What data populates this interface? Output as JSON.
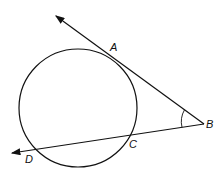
{
  "diagram": {
    "type": "geometry",
    "points": {
      "A": {
        "label": "A",
        "x": 114,
        "y": 57
      },
      "B": {
        "label": "B",
        "x": 204,
        "y": 124
      },
      "C": {
        "label": "C",
        "x": 131,
        "y": 134
      },
      "D": {
        "label": "D",
        "x": 30,
        "y": 151
      }
    },
    "circle": {
      "cx": 78,
      "cy": 108,
      "r": 59
    },
    "lines": [
      {
        "name": "tangent-ray-BA",
        "from": "B",
        "to_arrow": [
          55,
          15
        ]
      },
      {
        "name": "secant-ray-BD",
        "from": "B",
        "to_arrow": [
          11,
          153
        ]
      }
    ],
    "angle_mark": {
      "vertex": "B"
    },
    "stroke_color": "#111111"
  }
}
